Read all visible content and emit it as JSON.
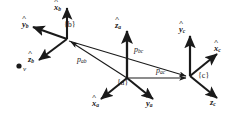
{
  "figure": {
    "background_color": "#ffffff",
    "stroke_color": "#1a1a1a",
    "width": 235,
    "height": 118
  },
  "frames": [
    {
      "id": "b",
      "label": "{b}",
      "label_pos": {
        "x": 66,
        "y": 25
      },
      "origin": {
        "x": 67,
        "y": 39
      },
      "axes": [
        {
          "name": "x-hat-b",
          "symbol": "x",
          "subscript": "b",
          "tip": {
            "x": 67,
            "y": 6
          },
          "label_pos": {
            "x": 56,
            "y": 4
          }
        },
        {
          "name": "y-hat-b",
          "symbol": "y",
          "subscript": "b",
          "tip": {
            "x": 31,
            "y": 26
          },
          "label_pos": {
            "x": 24,
            "y": 23
          }
        },
        {
          "name": "z-hat-b",
          "symbol": "z",
          "subscript": "b",
          "tip": {
            "x": 37,
            "y": 61
          },
          "label_pos": {
            "x": 30,
            "y": 57
          }
        }
      ]
    },
    {
      "id": "a",
      "label": "{a}",
      "label_pos": {
        "x": 120,
        "y": 83
      },
      "origin": {
        "x": 127,
        "y": 78
      },
      "axes": [
        {
          "name": "z-hat-a",
          "symbol": "z",
          "subscript": "a",
          "tip": {
            "x": 127,
            "y": 29
          },
          "label_pos": {
            "x": 118,
            "y": 24
          }
        },
        {
          "name": "x-hat-a",
          "symbol": "x",
          "subscript": "a",
          "tip": {
            "x": 99,
            "y": 101
          },
          "label_pos": {
            "x": 95,
            "y": 102
          }
        },
        {
          "name": "y-hat-a",
          "symbol": "y",
          "subscript": "a",
          "tip": {
            "x": 155,
            "y": 101
          },
          "label_pos": {
            "x": 149,
            "y": 102
          }
        }
      ]
    },
    {
      "id": "c",
      "label": "{c}",
      "label_pos": {
        "x": 200,
        "y": 76
      },
      "origin": {
        "x": 190,
        "y": 76
      },
      "axes": [
        {
          "name": "y-hat-c",
          "symbol": "y",
          "subscript": "c",
          "tip": {
            "x": 190,
            "y": 34
          },
          "label_pos": {
            "x": 181,
            "y": 28
          }
        },
        {
          "name": "x-hat-c",
          "symbol": "x",
          "subscript": "c",
          "tip": {
            "x": 219,
            "y": 52
          },
          "label_pos": {
            "x": 216,
            "y": 46
          }
        },
        {
          "name": "z-hat-c",
          "symbol": "z",
          "subscript": "c",
          "tip": {
            "x": 219,
            "y": 100
          },
          "label_pos": {
            "x": 213,
            "y": 100
          }
        }
      ]
    }
  ],
  "vectors": [
    {
      "id": "p_ab",
      "name": "vector-p-ab",
      "symbol": "p",
      "subscript": "ab",
      "from": {
        "x": 127,
        "y": 78
      },
      "to": {
        "x": 69,
        "y": 41
      },
      "label_pos": {
        "x": 80,
        "y": 58
      }
    },
    {
      "id": "p_bc",
      "name": "vector-p-bc",
      "symbol": "p",
      "subscript": "bc",
      "from": {
        "x": 69,
        "y": 41
      },
      "to": {
        "x": 188,
        "y": 77
      },
      "label_pos": {
        "x": 136,
        "y": 48
      }
    },
    {
      "id": "p_ac",
      "name": "vector-p-ac",
      "symbol": "p",
      "subscript": "ac",
      "from": {
        "x": 127,
        "y": 78
      },
      "to": {
        "x": 188,
        "y": 78
      },
      "label_pos": {
        "x": 158,
        "y": 70
      }
    }
  ],
  "points": [
    {
      "id": "v",
      "name": "point-v",
      "label": "v",
      "center": {
        "x": 19,
        "y": 66
      },
      "radius": 2.6,
      "label_pos": {
        "x": 24,
        "y": 68
      }
    }
  ]
}
